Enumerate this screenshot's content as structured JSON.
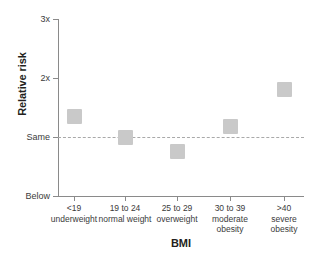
{
  "chart_data": {
    "type": "scatter",
    "title": "",
    "xlabel": "BMI",
    "ylabel": "Relative risk",
    "grid": false,
    "legend": "none",
    "categories": [
      "<19 underweight",
      "19 to 24 normal weight",
      "25 to 29 overweight",
      "30 to 39 moderate obesity",
      ">40 severe obesity"
    ],
    "category_lines": [
      [
        "<19",
        "underweight"
      ],
      [
        "19 to 24",
        "normal weight"
      ],
      [
        "25 to 29",
        "overweight"
      ],
      [
        "30 to 39",
        "moderate",
        "obesity"
      ],
      [
        ">40",
        "severe",
        "obesity"
      ]
    ],
    "values": [
      1.35,
      1.0,
      0.75,
      1.17,
      1.8
    ],
    "ytick_labels": [
      "3x",
      "2x",
      "Same",
      "Below"
    ],
    "ytick_values": [
      3,
      2,
      1,
      0
    ],
    "ylim": [
      0,
      3
    ],
    "reference_line": {
      "label": "Same",
      "value": 1,
      "style": "dashed"
    },
    "marker_color": "#c9c9c9",
    "axis_color": "#8a8a8a"
  },
  "axes": {
    "y_title": "Relative risk",
    "x_title": "BMI",
    "y_labels": {
      "t3": "3x",
      "t2": "2x",
      "t1": "Same",
      "t0": "Below"
    }
  },
  "categories": [
    {
      "line1": "<19",
      "line2": "underweight",
      "line3": ""
    },
    {
      "line1": "19 to 24",
      "line2": "normal weight",
      "line3": ""
    },
    {
      "line1": "25 to 29",
      "line2": "overweight",
      "line3": ""
    },
    {
      "line1": "30 to 39",
      "line2": "moderate",
      "line3": "obesity"
    },
    {
      "line1": ">40",
      "line2": "severe",
      "line3": "obesity"
    }
  ]
}
